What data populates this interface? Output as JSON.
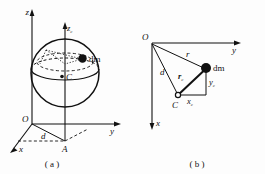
{
  "figure": {
    "background_color": "#fdfdfd",
    "ink_color": "#111111",
    "width": 265,
    "height": 174,
    "panels": [
      {
        "id": "a",
        "caption": "( a )",
        "description": "sphere-with-axes",
        "labels": {
          "axis_z": "z",
          "axis_zc": "z",
          "axis_zc_sub": "c",
          "axis_y": "y",
          "axis_x": "x",
          "origin": "O",
          "center": "C",
          "mass_element": "dm",
          "offset": "d",
          "foot_point": "A"
        }
      },
      {
        "id": "b",
        "caption": "( b )",
        "description": "planar-vector-detail",
        "labels": {
          "origin": "O",
          "axis_y": "y",
          "axis_x": "x",
          "center": "C",
          "mass_element": "dm",
          "radius_r": "r",
          "offset_d": "d",
          "vector_rc": "r",
          "vector_rc_sub": "c",
          "comp_xc": "x",
          "comp_xc_sub": "c",
          "comp_yc": "y",
          "comp_yc_sub": "c"
        }
      }
    ]
  }
}
